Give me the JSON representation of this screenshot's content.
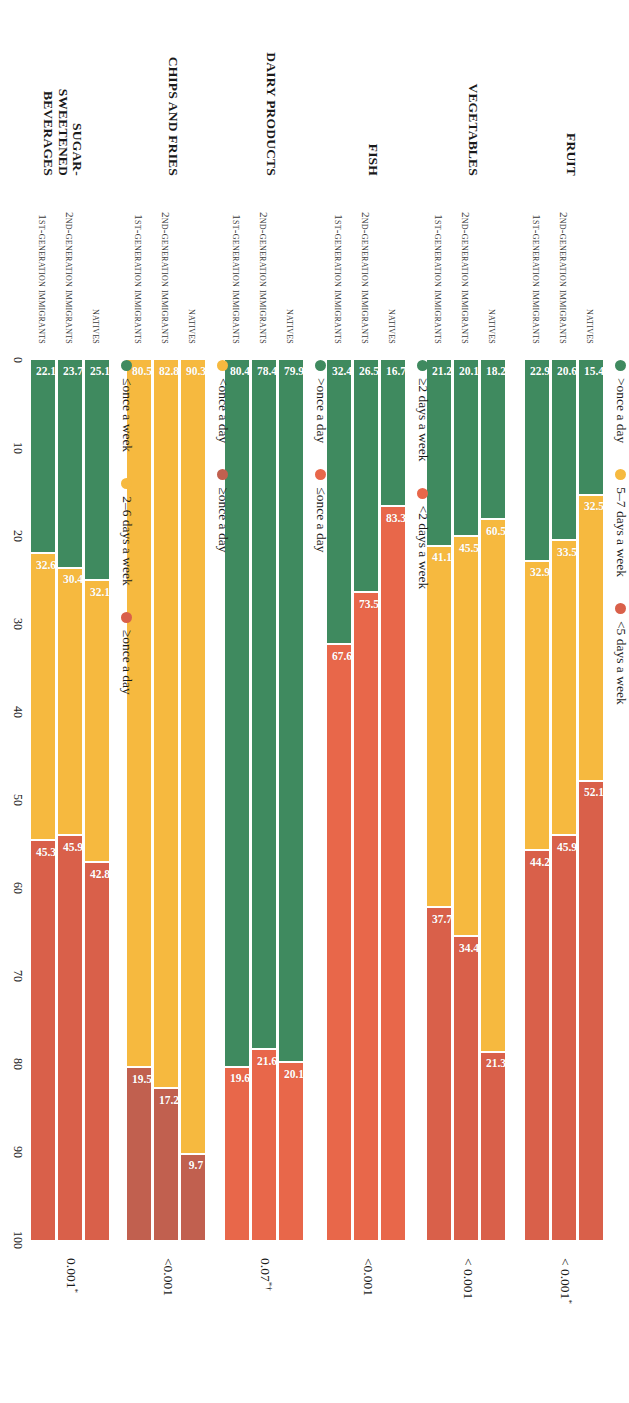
{
  "colors": {
    "green": "#3f8a5f",
    "yellow": "#f6b93f",
    "red": "#d9604a",
    "red_dark": "#c1604f",
    "text": "#1a1a1a"
  },
  "axis": {
    "min": 0,
    "max": 100,
    "ticks": [
      "0",
      "10",
      "20",
      "30",
      "40",
      "50",
      "60",
      "70",
      "80",
      "90",
      "100"
    ]
  },
  "groups": [
    "Natives",
    "2nd-generation immigrants",
    "1st-generation immigrants"
  ],
  "chart_data": {
    "type": "bar",
    "title": "",
    "xlabel": "",
    "ylabel": "",
    "xlim": [
      0,
      100
    ],
    "grid": false,
    "orientation": "horizontal-stacked",
    "categories": [
      "Natives",
      "2nd-generation immigrants",
      "1st-generation immigrants"
    ],
    "panels": [
      {
        "name": "Fruit",
        "p_value": "< 0.001",
        "p_marks": "*",
        "legend": [
          {
            "label": ">once a day",
            "color": "#3f8a5f"
          },
          {
            "label": "5–7 days a week",
            "color": "#f6b93f"
          },
          {
            "label": "<5 days a week",
            "color": "#d9604a"
          }
        ],
        "series": [
          {
            "name": ">once a day",
            "color": "#3f8a5f",
            "values": [
              15.4,
              20.6,
              22.9
            ]
          },
          {
            "name": "5–7 days a week",
            "color": "#f6b93f",
            "values": [
              32.5,
              33.5,
              32.9
            ]
          },
          {
            "name": "<5 days a week",
            "color": "#d9604a",
            "values": [
              52.1,
              45.9,
              44.2
            ]
          }
        ]
      },
      {
        "name": "Vegetables",
        "p_value": "< 0.001",
        "p_marks": "",
        "legend": [],
        "series": [
          {
            "name": ">once a day",
            "color": "#3f8a5f",
            "values": [
              18.2,
              20.1,
              21.2
            ]
          },
          {
            "name": "5–7 days a week",
            "color": "#f6b93f",
            "values": [
              60.5,
              45.5,
              41.1
            ]
          },
          {
            "name": "<5 days a week",
            "color": "#d9604a",
            "values": [
              21.3,
              34.4,
              37.7
            ]
          }
        ]
      },
      {
        "name": "Fish",
        "p_value": "<0.001",
        "p_marks": "",
        "legend": [
          {
            "label": "≥2 days a week",
            "color": "#3f8a5f"
          },
          {
            "label": "<2 days a week",
            "color": "#e8674a"
          }
        ],
        "series": [
          {
            "name": "≥2 days a week",
            "color": "#3f8a5f",
            "values": [
              16.7,
              26.5,
              32.4
            ]
          },
          {
            "name": "<2 days a week",
            "color": "#e8674a",
            "values": [
              83.3,
              73.5,
              67.6
            ]
          }
        ]
      },
      {
        "name": "Dairy products",
        "p_value": "0.07",
        "p_marks": "*†",
        "legend": [
          {
            "label": ">once a day",
            "color": "#3f8a5f"
          },
          {
            "label": "≤once a day",
            "color": "#e8674a"
          }
        ],
        "series": [
          {
            "name": ">once a day",
            "color": "#3f8a5f",
            "values": [
              79.9,
              78.4,
              80.4
            ]
          },
          {
            "name": "≤once a day",
            "color": "#e8674a",
            "values": [
              20.1,
              21.6,
              19.6
            ]
          }
        ]
      },
      {
        "name": "Chips and fries",
        "p_value": "<0.001",
        "p_marks": "",
        "legend": [
          {
            "label": "<once a day",
            "color": "#f6b93f"
          },
          {
            "label": "≥once a day",
            "color": "#c1604f"
          }
        ],
        "series": [
          {
            "name": "<once a day",
            "color": "#f6b93f",
            "values": [
              90.3,
              82.8,
              80.5
            ]
          },
          {
            "name": "≥once a day",
            "color": "#c1604f",
            "values": [
              9.7,
              17.2,
              19.5
            ]
          }
        ]
      },
      {
        "name": "Sugar-\nsweetened\nbeverages",
        "p_value": "0.001",
        "p_marks": "*",
        "legend": [
          {
            "label": "≤once a week",
            "color": "#3f8a5f"
          },
          {
            "label": "2–6 days a week",
            "color": "#f6b93f"
          },
          {
            "label": "≥once a day",
            "color": "#d9604a"
          }
        ],
        "series": [
          {
            "name": "≤once a week",
            "color": "#3f8a5f",
            "values": [
              25.1,
              23.7,
              22.1
            ]
          },
          {
            "name": "2–6 days a week",
            "color": "#f6b93f",
            "values": [
              32.1,
              30.4,
              32.6
            ]
          },
          {
            "name": "≥once a day",
            "color": "#d9604a",
            "values": [
              42.8,
              45.9,
              45.3
            ]
          }
        ]
      }
    ]
  }
}
